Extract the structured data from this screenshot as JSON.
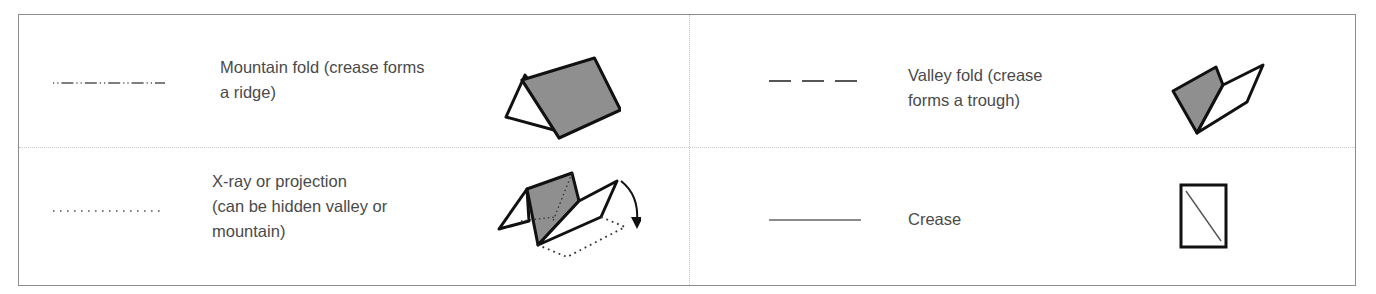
{
  "legend": {
    "items": [
      {
        "id": "mountain-fold",
        "line_style": "dash-dot-dot",
        "label": "Mountain fold (crease forms\na ridge)",
        "icon": "mountain-fold-icon"
      },
      {
        "id": "valley-fold",
        "line_style": "dashed",
        "label": "Valley fold (crease\nforms a trough)",
        "icon": "valley-fold-icon"
      },
      {
        "id": "xray",
        "line_style": "dotted",
        "label": "X-ray or projection\n(can be hidden valley or\nmountain)",
        "icon": "xray-projection-icon"
      },
      {
        "id": "crease",
        "line_style": "solid-thin",
        "label": "Crease",
        "icon": "crease-square-icon"
      }
    ],
    "colors": {
      "border": "#8c8c8c",
      "divider": "#c8c8c8",
      "text": "#4a4a4a",
      "fill_gray": "#8f8f8f",
      "stroke": "#111111",
      "line_symbol": "#555555"
    }
  }
}
